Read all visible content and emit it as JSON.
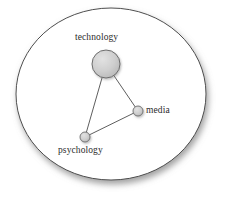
{
  "figure": {
    "type": "node-link-diagram",
    "background_color": "#ffffff",
    "boundary": {
      "shape": "ellipse",
      "name": "cluster-boundary",
      "center_x": 111,
      "center_y": 94,
      "radius_x": 95,
      "radius_y": 86,
      "stroke_color": "#3a3a3a",
      "fill_color": "#ffffff",
      "has_drop_shadow": true,
      "shadow_color": "#9a9a9a"
    },
    "nodes": [
      {
        "id": "technology",
        "label": "technology",
        "cx": 106,
        "cy": 64,
        "r": 14,
        "fill_color": "#c9c9c9",
        "stroke_color": "#6e6e6e",
        "label_x": 75,
        "label_y": 33
      },
      {
        "id": "media",
        "label": "media",
        "cx": 138,
        "cy": 111,
        "r": 5,
        "fill_color": "#c9c9c9",
        "stroke_color": "#6e6e6e",
        "label_x": 146,
        "label_y": 106
      },
      {
        "id": "psychology",
        "label": "psychology",
        "cx": 85,
        "cy": 137,
        "r": 5,
        "fill_color": "#c9c9c9",
        "stroke_color": "#6e6e6e",
        "label_x": 58,
        "label_y": 146
      }
    ],
    "edges": [
      {
        "id": "technology-media",
        "source": "technology",
        "target": "media",
        "stroke_color": "#555555"
      },
      {
        "id": "technology-psychology",
        "source": "technology",
        "target": "psychology",
        "stroke_color": "#555555"
      },
      {
        "id": "media-psychology",
        "source": "media",
        "target": "psychology",
        "stroke_color": "#555555"
      }
    ]
  }
}
